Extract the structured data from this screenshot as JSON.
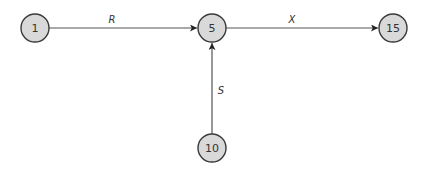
{
  "diagram": {
    "nodes": [
      {
        "id": "1",
        "label": "1",
        "x": 35,
        "y": 28
      },
      {
        "id": "5",
        "label": "5",
        "x": 212,
        "y": 28
      },
      {
        "id": "15",
        "label": "15",
        "x": 393,
        "y": 28
      },
      {
        "id": "10",
        "label": "10",
        "x": 212,
        "y": 148
      }
    ],
    "edges": [
      {
        "from": "1",
        "to": "5",
        "label": "R"
      },
      {
        "from": "5",
        "to": "15",
        "label": "X"
      },
      {
        "from": "10",
        "to": "5",
        "label": "S"
      }
    ],
    "colors": {
      "node_fill": "#d9d9d9",
      "node_stroke": "#3a3a3a",
      "edge": "#555555"
    }
  }
}
